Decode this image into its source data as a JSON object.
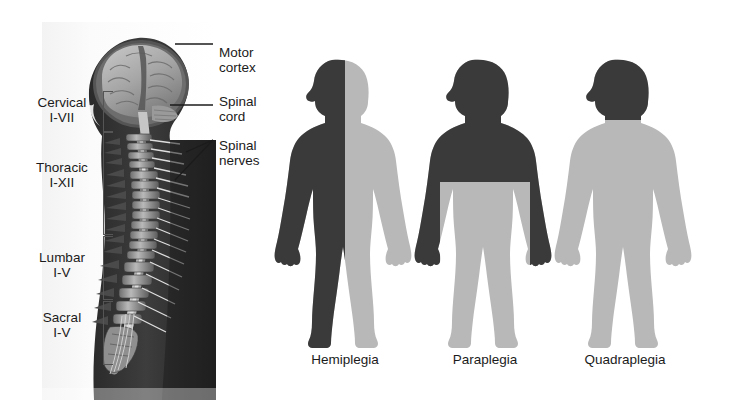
{
  "colors": {
    "background": "#ffffff",
    "affected_dark": "#3a3a3a",
    "unaffected_light": "#b8b8b8",
    "text": "#1b1b1b",
    "bracket": "#555555",
    "leader_line": "#1b1b1b"
  },
  "anatomy": {
    "alt": "lateral view illustration of brain, spinal cord and vertebral column",
    "regions": [
      {
        "name": "Cervical",
        "range": "I-VII"
      },
      {
        "name": "Thoracic",
        "range": "I-XII"
      },
      {
        "name": "Lumbar",
        "range": "I-V"
      },
      {
        "name": "Sacral",
        "range": "I-V"
      }
    ],
    "callouts": [
      {
        "label": "Motor\ncortex"
      },
      {
        "label": "Spinal\ncord"
      },
      {
        "label": "Spinal\nnerves"
      }
    ]
  },
  "figures": [
    {
      "caption": "Hemiplegia",
      "affected_description": "one vertical half of the body, head to foot",
      "affected_regions": [
        "left-half-head",
        "left-half-trunk",
        "left-arm",
        "left-leg"
      ],
      "unaffected_regions": [
        "right-half-head",
        "right-half-trunk",
        "right-arm",
        "right-leg"
      ]
    },
    {
      "caption": "Paraplegia",
      "affected_description": "both legs and lower trunk below the waist",
      "affected_regions": [
        "both-legs",
        "pelvis"
      ],
      "unaffected_regions": [
        "head",
        "upper-trunk",
        "both-arms"
      ]
    },
    {
      "caption": "Quadraplegia",
      "affected_description": "entire body below the neck, all four limbs",
      "affected_regions": [
        "trunk",
        "both-arms",
        "both-legs"
      ],
      "unaffected_regions": [
        "head"
      ]
    }
  ]
}
